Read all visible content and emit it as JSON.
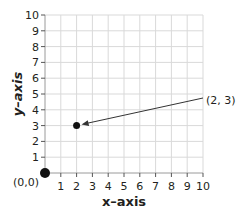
{
  "chart_data": {
    "type": "scatter",
    "title": "",
    "xlabel": "x–axis",
    "ylabel": "y–axis",
    "xlim": [
      0,
      10
    ],
    "ylim": [
      0,
      10
    ],
    "grid": true,
    "x_ticks": [
      "1",
      "2",
      "3",
      "4",
      "5",
      "6",
      "7",
      "8",
      "9",
      "10"
    ],
    "y_ticks": [
      "1",
      "2",
      "3",
      "4",
      "5",
      "6",
      "7",
      "8",
      "9",
      "10"
    ],
    "points": [
      {
        "x": 0,
        "y": 0,
        "label": "(0,0)"
      },
      {
        "x": 2,
        "y": 3,
        "label": "(2, 3)"
      }
    ],
    "annotations": [
      {
        "text": "(2, 3)",
        "arrow_to": [
          2,
          3
        ]
      },
      {
        "text": "(0,0)",
        "at": [
          0,
          0
        ]
      }
    ]
  },
  "labels": {
    "xlabel": "x–axis",
    "ylabel": "y–axis",
    "origin": "(0,0)",
    "point_label": "(2, 3)"
  }
}
